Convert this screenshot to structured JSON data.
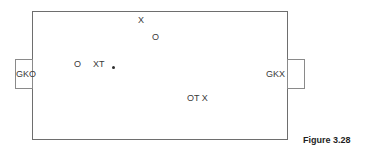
{
  "figure": {
    "caption": "Figure 3.28",
    "pitch": {
      "name": "pitch-outline"
    },
    "goals": [
      {
        "id": "left",
        "label": "GKO"
      },
      {
        "id": "right",
        "label": "GKX"
      }
    ],
    "markers": [
      {
        "id": "top-x",
        "label": "X",
        "x": 138,
        "y": 16
      },
      {
        "id": "top-o",
        "label": "O",
        "x": 152,
        "y": 33
      },
      {
        "id": "left-o",
        "label": "O",
        "x": 74,
        "y": 60
      },
      {
        "id": "left-xt",
        "label": "XT",
        "x": 93,
        "y": 60
      },
      {
        "id": "lower-ot-x",
        "label": "OT  X",
        "x": 187,
        "y": 94
      }
    ],
    "ball": {
      "id": "ball",
      "x": 112,
      "y": 66
    },
    "colors": {
      "line": "#6e6e6e",
      "goal_line": "#8a8a8a",
      "text": "#3a3a3a",
      "caption": "#1e1e1e",
      "ball": "#2e2e2e",
      "background": "#ffffff"
    }
  }
}
